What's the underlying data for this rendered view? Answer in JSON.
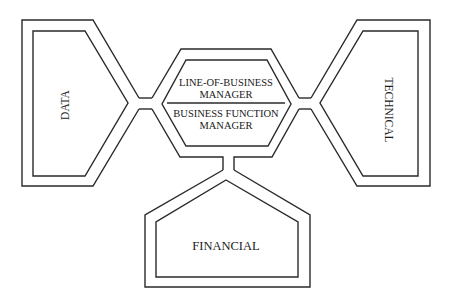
{
  "diagram": {
    "center": {
      "top_label_line1": "LINE-OF-BUSINESS",
      "top_label_line2": "MANAGER",
      "bottom_label_line1": "BUSINESS FUNCTION",
      "bottom_label_line2": "MANAGER"
    },
    "nodes": {
      "left": {
        "label": "DATA"
      },
      "right": {
        "label": "TECHNICAL"
      },
      "bottom": {
        "label": "FINANCIAL"
      }
    },
    "colors": {
      "stroke": "#2a2a2a",
      "background": "#ffffff",
      "text": "#1a1a1a"
    }
  }
}
